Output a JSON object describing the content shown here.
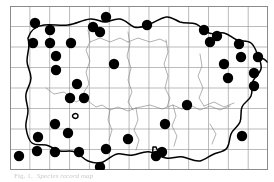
{
  "figure": {
    "type": "species-distribution-dot-map",
    "caption_number": "Fig. 1.",
    "caption_text": "Species record map",
    "background_color": "#ffffff",
    "ink_color": "#000000"
  },
  "map": {
    "frame": {
      "x": 10,
      "y": 6,
      "width": 258,
      "height": 164,
      "border_color": "#8a8a8a",
      "border_width": 1
    },
    "grid": {
      "visible": true,
      "columns": 13,
      "rows": 8,
      "cell_width": 19.85,
      "cell_height": 20.5,
      "line_color": "#9d9d9d",
      "line_width": 0.7
    },
    "coastline": {
      "stroke_color": "#000000",
      "stroke_width": 1.5,
      "label": "island-coastline"
    },
    "internal_boundaries": {
      "stroke_color": "#7c7c7c",
      "stroke_width": 0.6,
      "label": "parish-boundaries"
    }
  },
  "chart_data": {
    "type": "scatter",
    "title": "Species record map",
    "xlabel": "",
    "ylabel": "",
    "xlim": [
      0,
      258
    ],
    "ylim": [
      0,
      164
    ],
    "grid": true,
    "legend": null,
    "series": [
      {
        "name": "records",
        "marker": "filled-circle",
        "marker_color": "#000000",
        "marker_radius": 5.2,
        "count": 40,
        "points": [
          [
            25,
            17
          ],
          [
            96,
            11
          ],
          [
            40,
            24
          ],
          [
            90,
            26
          ],
          [
            137,
            19
          ],
          [
            194,
            24
          ],
          [
            23,
            37
          ],
          [
            40,
            37
          ],
          [
            200,
            36
          ],
          [
            229,
            38
          ],
          [
            46,
            50
          ],
          [
            231,
            51
          ],
          [
            248,
            51
          ],
          [
            46,
            64
          ],
          [
            244,
            67
          ],
          [
            67,
            78
          ],
          [
            244,
            80
          ],
          [
            60,
            92
          ],
          [
            74,
            92
          ],
          [
            45,
            118
          ],
          [
            28,
            131
          ],
          [
            58,
            127
          ],
          [
            27,
            145
          ],
          [
            45,
            146
          ],
          [
            69,
            146
          ],
          [
            96,
            143
          ],
          [
            90,
            161
          ],
          [
            155,
            118
          ],
          [
            152,
            146
          ],
          [
            232,
            130
          ],
          [
            9,
            150
          ],
          [
            118,
            133
          ],
          [
            146,
            150
          ],
          [
            104,
            58
          ],
          [
            177,
            99
          ],
          [
            83,
            21
          ],
          [
            61,
            37
          ],
          [
            207,
            30
          ],
          [
            214,
            58
          ],
          [
            218,
            72
          ]
        ]
      }
    ]
  }
}
